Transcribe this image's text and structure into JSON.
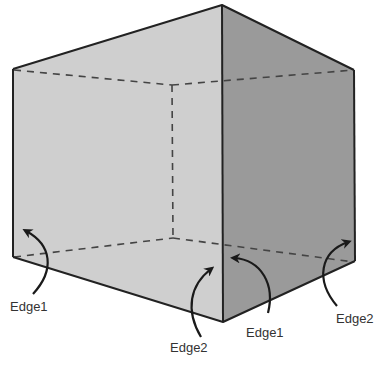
{
  "diagram": {
    "type": "open-box-3d",
    "colors": {
      "left_face": "#cfcfcf",
      "right_face": "#9a9a9a",
      "edge": "#222222",
      "hidden_edge": "#444444",
      "background": "#ffffff"
    },
    "labels": [
      {
        "id": "left-edge1",
        "text": "Edge1"
      },
      {
        "id": "front-edge2",
        "text": "Edge2"
      },
      {
        "id": "front-edge1",
        "text": "Edge1"
      },
      {
        "id": "right-edge2",
        "text": "Edge2"
      }
    ]
  }
}
